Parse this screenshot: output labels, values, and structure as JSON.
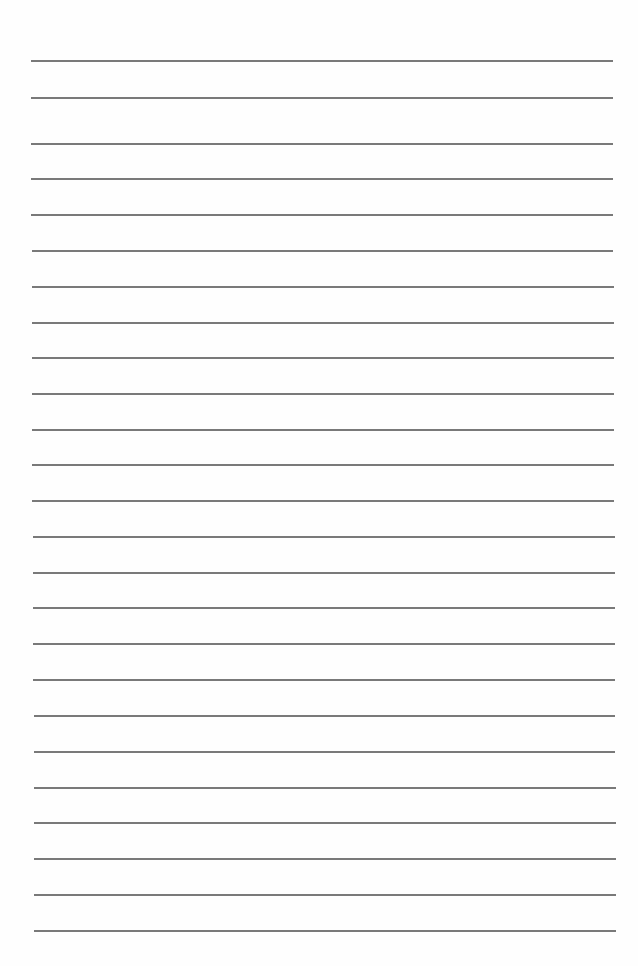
{
  "page": {
    "type": "blank lined paper",
    "background_color": "#fefefe",
    "line_color": "#6a6a6a"
  },
  "rules": [
    {
      "y": 60,
      "x1": 31,
      "x2": 613
    },
    {
      "y": 97,
      "x1": 31,
      "x2": 613
    },
    {
      "y": 143,
      "x1": 31,
      "x2": 613
    },
    {
      "y": 178,
      "x1": 31,
      "x2": 613
    },
    {
      "y": 214,
      "x1": 31,
      "x2": 613
    },
    {
      "y": 250,
      "x1": 32,
      "x2": 613
    },
    {
      "y": 286,
      "x1": 32,
      "x2": 614
    },
    {
      "y": 322,
      "x1": 32,
      "x2": 614
    },
    {
      "y": 357,
      "x1": 32,
      "x2": 614
    },
    {
      "y": 393,
      "x1": 32,
      "x2": 614
    },
    {
      "y": 429,
      "x1": 32,
      "x2": 614
    },
    {
      "y": 464,
      "x1": 32,
      "x2": 614
    },
    {
      "y": 500,
      "x1": 32,
      "x2": 614
    },
    {
      "y": 536,
      "x1": 33,
      "x2": 615
    },
    {
      "y": 572,
      "x1": 33,
      "x2": 615
    },
    {
      "y": 607,
      "x1": 33,
      "x2": 615
    },
    {
      "y": 643,
      "x1": 33,
      "x2": 615
    },
    {
      "y": 679,
      "x1": 33,
      "x2": 615
    },
    {
      "y": 715,
      "x1": 34,
      "x2": 615
    },
    {
      "y": 751,
      "x1": 34,
      "x2": 615
    },
    {
      "y": 787,
      "x1": 34,
      "x2": 616
    },
    {
      "y": 822,
      "x1": 34,
      "x2": 616
    },
    {
      "y": 858,
      "x1": 34,
      "x2": 616
    },
    {
      "y": 894,
      "x1": 34,
      "x2": 616
    },
    {
      "y": 930,
      "x1": 34,
      "x2": 616
    }
  ]
}
